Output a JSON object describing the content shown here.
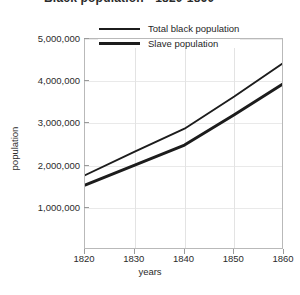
{
  "chart_data": {
    "type": "line",
    "title": "Black population - 1820-1860",
    "xlabel": "years",
    "ylabel": "population",
    "x": [
      1820,
      1830,
      1840,
      1850,
      1860
    ],
    "xlim": [
      1820,
      1860
    ],
    "ylim": [
      0,
      5000000
    ],
    "xticks": [
      "1820",
      "1830",
      "1840",
      "1850",
      "1860"
    ],
    "yticks": [
      "1,000,000",
      "2,000,000",
      "3,000,000",
      "4,000,000",
      "5,000,000"
    ],
    "ytick_values": [
      1000000,
      2000000,
      3000000,
      4000000,
      5000000
    ],
    "grid": true,
    "legend_position": "top-center",
    "series": [
      {
        "name": "Total black population",
        "values": [
          1772000,
          2329000,
          2874000,
          3639000,
          4442000
        ],
        "color": "#1c1c1c",
        "line_width": 1.9
      },
      {
        "name": "Slave population",
        "values": [
          1538000,
          2009000,
          2487000,
          3205000,
          3954000
        ],
        "color": "#1c1c1c",
        "line_width": 2.9
      }
    ]
  },
  "legend": {
    "items": [
      {
        "label": "Total black population",
        "swatch": "thin-line-swatch"
      },
      {
        "label": "Slave population",
        "swatch": "thick-line-swatch"
      }
    ]
  }
}
